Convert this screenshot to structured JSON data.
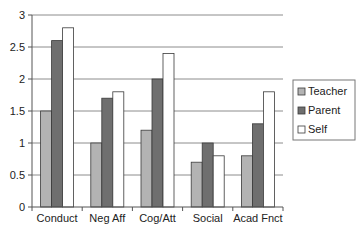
{
  "chart_data": {
    "type": "bar",
    "title": "",
    "xlabel": "",
    "ylabel": "",
    "categories": [
      "Conduct",
      "Neg Aff",
      "Cog/Att",
      "Social",
      "Acad Fnct"
    ],
    "series": [
      {
        "name": "Teacher",
        "color": "#b3b3b3",
        "values": [
          1.5,
          1.0,
          1.2,
          0.7,
          0.8
        ]
      },
      {
        "name": "Parent",
        "color": "#6f6f6f",
        "values": [
          2.6,
          1.7,
          2.0,
          1.0,
          1.3
        ]
      },
      {
        "name": "Self",
        "color": "#ffffff",
        "values": [
          2.8,
          1.8,
          2.4,
          0.8,
          1.8
        ]
      }
    ],
    "ylim": [
      0,
      3
    ],
    "yticks": [
      0,
      0.5,
      1,
      1.5,
      2,
      2.5,
      3
    ],
    "ytick_labels": [
      "0",
      "0.5",
      "1",
      "1.5",
      "2",
      "2.5",
      "3"
    ],
    "grid": true,
    "legend_position": "right"
  }
}
